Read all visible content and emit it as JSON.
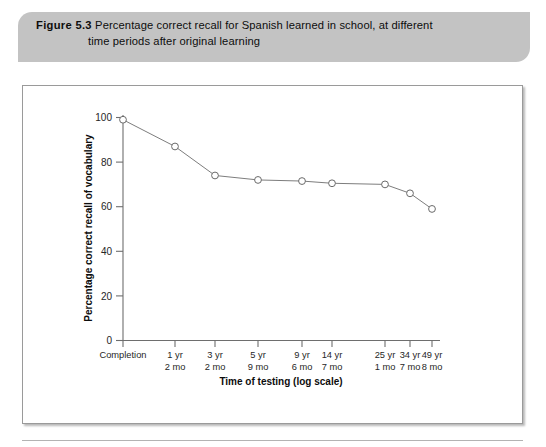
{
  "caption": {
    "figure_label": "Figure 5.3",
    "line1": "Percentage correct recall for Spanish learned in school, at different",
    "line2": "time periods after original learning"
  },
  "chart_data": {
    "type": "line",
    "title": "Percentage correct recall for Spanish learned in school, at different time periods after original learning",
    "xlabel": "Time of testing (log scale)",
    "ylabel": "Percentage correct recall of vocabulary",
    "grid": false,
    "legend": "none",
    "ylim": [
      0,
      100
    ],
    "yticks": [
      "0",
      "20",
      "40",
      "60",
      "80",
      "100"
    ],
    "categories": [
      "Completion",
      "1 yr 2 mo",
      "3 yr 2 mo",
      "5 yr 9 mo",
      "9 yr 6 mo",
      "14 yr 7 mo",
      "25 yr 1 mo",
      "34 yr 7 mo",
      "49 yr 8 mo"
    ],
    "category_lines": [
      [
        "Completion",
        ""
      ],
      [
        "1 yr",
        "2 mo"
      ],
      [
        "3 yr",
        "2 mo"
      ],
      [
        "5 yr",
        "9 mo"
      ],
      [
        "9 yr",
        "6 mo"
      ],
      [
        "14 yr",
        "7 mo"
      ],
      [
        "25 yr",
        "1 mo"
      ],
      [
        "34 yr",
        "7 mo"
      ],
      [
        "49 yr",
        "8 mo"
      ]
    ],
    "values": [
      99,
      87,
      74,
      72,
      71.5,
      70.5,
      70,
      66,
      59
    ],
    "x_positions": [
      123,
      175,
      215,
      258,
      302,
      332,
      385,
      410,
      432
    ],
    "marker": "open-circle",
    "line_color": "#7d7d7d",
    "marker_fill": "#ffffff",
    "marker_stroke": "#6a6a6a"
  },
  "colors": {
    "caption_bar": "#c3c3c3",
    "frame_border": "#9a9a9a",
    "axis": "#6e6e6e",
    "text": "#0d0d0d"
  }
}
